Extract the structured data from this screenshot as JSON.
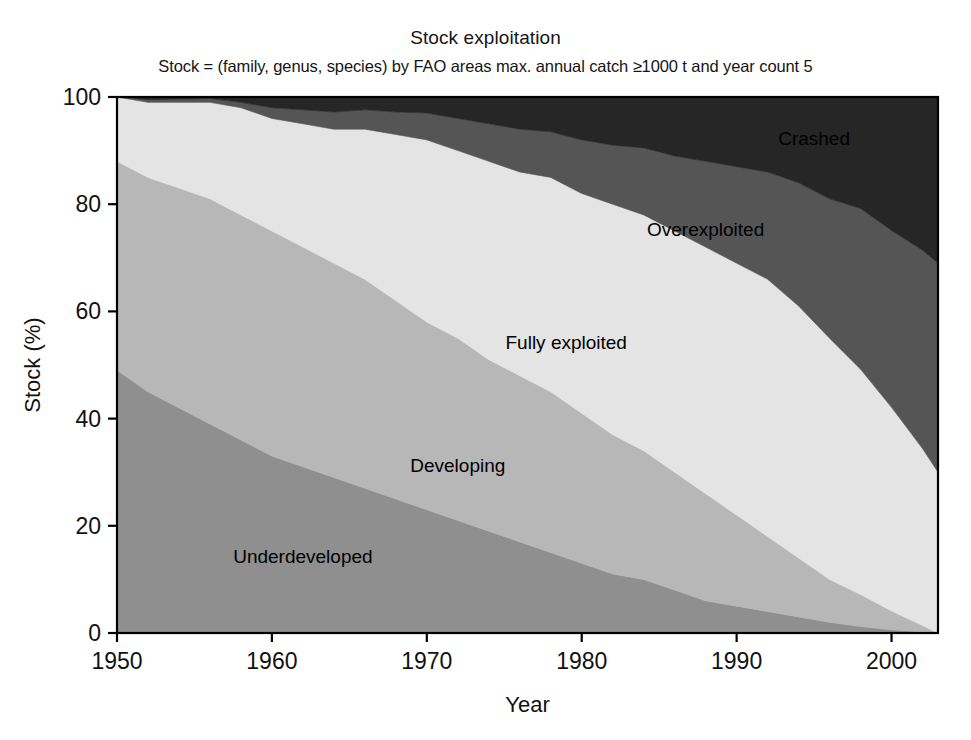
{
  "chart_data": {
    "type": "area",
    "stacked": true,
    "title": "Stock exploitation",
    "subtitle": "Stock = (family, genus, species) by FAO areas max. annual catch ≥1000 t and year count 5",
    "xlabel": "Year",
    "ylabel": "Stock (%)",
    "xlim": [
      1950,
      2003
    ],
    "ylim": [
      0,
      100
    ],
    "xticks": [
      1950,
      1960,
      1970,
      1980,
      1990,
      2000
    ],
    "xtick_labels": [
      "1950",
      "1960",
      "1970",
      "1980",
      "1990",
      "2000"
    ],
    "yticks": [
      0,
      20,
      40,
      60,
      80,
      100
    ],
    "ytick_labels": [
      "0",
      "20",
      "40",
      "60",
      "80",
      "100"
    ],
    "grid": false,
    "legend_position": "inline-labels",
    "x": [
      1950,
      1952,
      1954,
      1956,
      1958,
      1960,
      1962,
      1964,
      1966,
      1968,
      1970,
      1972,
      1974,
      1976,
      1978,
      1980,
      1982,
      1984,
      1986,
      1988,
      1990,
      1992,
      1994,
      1996,
      1998,
      2000,
      2002,
      2003
    ],
    "series": [
      {
        "name": "Underdeveloped",
        "color": "#8f8f8f",
        "label_x": 1962,
        "label_y": 14,
        "values": [
          49,
          45,
          42,
          39,
          36,
          33,
          31,
          29,
          27,
          25,
          23,
          21,
          19,
          17,
          15,
          13,
          11,
          10,
          8,
          6,
          5,
          4,
          3,
          2,
          1.2,
          0.6,
          0.2,
          0
        ]
      },
      {
        "name": "Developing",
        "color": "#b7b7b7",
        "label_x": 1972,
        "label_y": 31,
        "values": [
          39,
          40,
          41,
          42,
          42,
          42,
          41,
          40,
          39,
          37,
          35,
          34,
          32,
          31,
          30,
          28,
          26,
          24,
          22,
          20,
          17,
          14,
          11,
          8,
          6,
          3.5,
          1.2,
          0
        ]
      },
      {
        "name": "Fully exploited",
        "color": "#e4e4e4",
        "label_x": 1979,
        "label_y": 54,
        "values": [
          12,
          14,
          16,
          18,
          20,
          21,
          23,
          25,
          28,
          31,
          34,
          35,
          37,
          38,
          40,
          41,
          43,
          44,
          45,
          46,
          47,
          48,
          47,
          45,
          42,
          38,
          33,
          30
        ]
      },
      {
        "name": "Overexploited",
        "color": "#555555",
        "label_x": 1988,
        "label_y": 75,
        "values": [
          0,
          0.5,
          0.6,
          0.7,
          1.0,
          2.0,
          2.6,
          3.2,
          3.6,
          4.2,
          5.0,
          6.0,
          7.0,
          8.0,
          8.5,
          10,
          11,
          12.5,
          14,
          16,
          18,
          20,
          23,
          26,
          30,
          33,
          37,
          39
        ]
      },
      {
        "name": "Crashed",
        "color": "#262626",
        "label_x": 1995,
        "label_y": 92,
        "values": [
          0,
          0.5,
          0.4,
          0.3,
          1.0,
          2.0,
          2.4,
          2.8,
          2.4,
          2.8,
          3.0,
          4.0,
          5.0,
          6.0,
          6.5,
          8.0,
          9.0,
          9.5,
          11,
          12,
          13,
          14,
          16,
          19,
          20.8,
          24.9,
          28.6,
          31
        ]
      }
    ]
  },
  "figure": {
    "caption_sliver": ""
  }
}
